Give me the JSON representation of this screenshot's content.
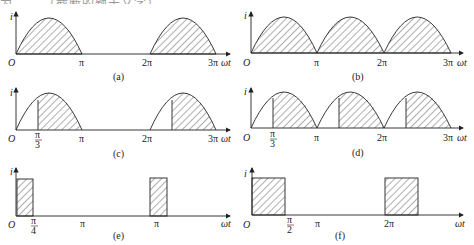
{
  "top_text": "为 ……（截断的题干文字）……",
  "axis": {
    "y_label": "i",
    "x_label": "ωt",
    "origin_label": "O"
  },
  "panels": [
    {
      "id": "a",
      "caption": "(a)",
      "description": "half-wave rectified sine, full half-cycles shaded",
      "ticks": [
        "π",
        "2π",
        "3π"
      ]
    },
    {
      "id": "b",
      "caption": "(b)",
      "description": "full-wave rectified sine, all humps shaded",
      "ticks": [
        "π",
        "2π",
        "3π"
      ]
    },
    {
      "id": "c",
      "caption": "(c)",
      "description": "half-wave sine with conduction starting at π/3",
      "ticks": [
        "π/3",
        "π",
        "2π",
        "3π"
      ],
      "cut_num": "π",
      "cut_den": "3"
    },
    {
      "id": "d",
      "caption": "(d)",
      "description": "full-wave sine with conduction starting at π/3 each half-cycle",
      "ticks": [
        "π/3",
        "π",
        "2π",
        "3π"
      ],
      "cut_num": "π",
      "cut_den": "3"
    },
    {
      "id": "e",
      "caption": "(e)",
      "description": "rectangular pulses of width π/4",
      "ticks": [
        "π/4",
        "π",
        "π"
      ],
      "cut_num": "π",
      "cut_den": "4"
    },
    {
      "id": "f",
      "caption": "(f)",
      "description": "rectangular pulses of width π/2",
      "ticks": [
        "π/2",
        "π",
        "2π"
      ],
      "cut_num": "π",
      "cut_den": "2"
    }
  ],
  "colors": {
    "line": "#222222",
    "hatch": "#333333",
    "background": "#ffffff"
  }
}
